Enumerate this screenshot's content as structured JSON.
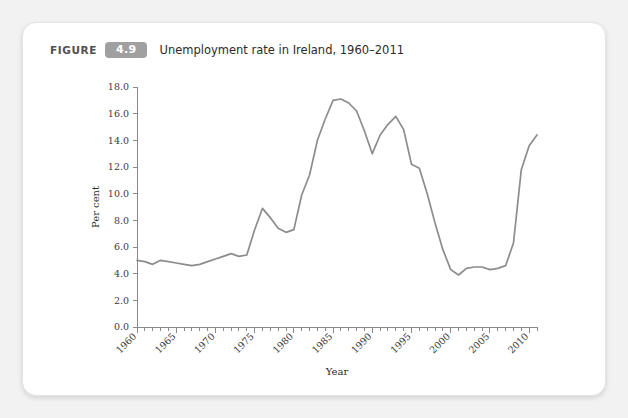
{
  "figure": {
    "label": "FIGURE",
    "number": "4.9",
    "title": "Unemployment rate in Ireland, 1960–2011"
  },
  "chart_data": {
    "type": "line",
    "title": "Unemployment rate in Ireland, 1960–2011",
    "xlabel": "Year",
    "ylabel": "Per cent",
    "xlim": [
      1960,
      2011
    ],
    "ylim": [
      0.0,
      18.0
    ],
    "grid": false,
    "legend": null,
    "y_ticks": [
      "0.0",
      "2.0",
      "4.0",
      "6.0",
      "8.0",
      "10.0",
      "12.0",
      "14.0",
      "16.0",
      "18.0"
    ],
    "y_tick_values": [
      0.0,
      2.0,
      4.0,
      6.0,
      8.0,
      10.0,
      12.0,
      14.0,
      16.0,
      18.0
    ],
    "x_ticks": [
      "1960",
      "1965",
      "1970",
      "1975",
      "1980",
      "1985",
      "1990",
      "1995",
      "2000",
      "2005",
      "2010"
    ],
    "x_tick_values": [
      1960,
      1965,
      1970,
      1975,
      1980,
      1985,
      1990,
      1995,
      2000,
      2005,
      2010
    ],
    "x_minor_tick_step": 1,
    "line_color": "#8c8c8c",
    "series": [
      {
        "name": "Unemployment rate",
        "x": [
          1960,
          1961,
          1962,
          1963,
          1964,
          1965,
          1966,
          1967,
          1968,
          1969,
          1970,
          1971,
          1972,
          1973,
          1974,
          1975,
          1976,
          1977,
          1978,
          1979,
          1980,
          1981,
          1982,
          1983,
          1984,
          1985,
          1986,
          1987,
          1988,
          1989,
          1990,
          1991,
          1992,
          1993,
          1994,
          1995,
          1996,
          1997,
          1998,
          1999,
          2000,
          2001,
          2002,
          2003,
          2004,
          2005,
          2006,
          2007,
          2008,
          2009,
          2010,
          2011
        ],
        "values": [
          5.0,
          4.9,
          4.7,
          5.0,
          4.9,
          4.8,
          4.7,
          4.6,
          4.7,
          4.9,
          5.1,
          5.3,
          5.5,
          5.3,
          5.4,
          7.3,
          8.9,
          8.2,
          7.4,
          7.1,
          7.3,
          9.9,
          11.4,
          14.0,
          15.6,
          17.0,
          17.1,
          16.8,
          16.2,
          14.7,
          13.0,
          14.4,
          15.2,
          15.8,
          14.8,
          12.2,
          11.9,
          10.0,
          7.8,
          5.8,
          4.3,
          3.9,
          4.4,
          4.5,
          4.5,
          4.3,
          4.4,
          4.6,
          6.3,
          11.8,
          13.6,
          14.4
        ]
      }
    ]
  }
}
